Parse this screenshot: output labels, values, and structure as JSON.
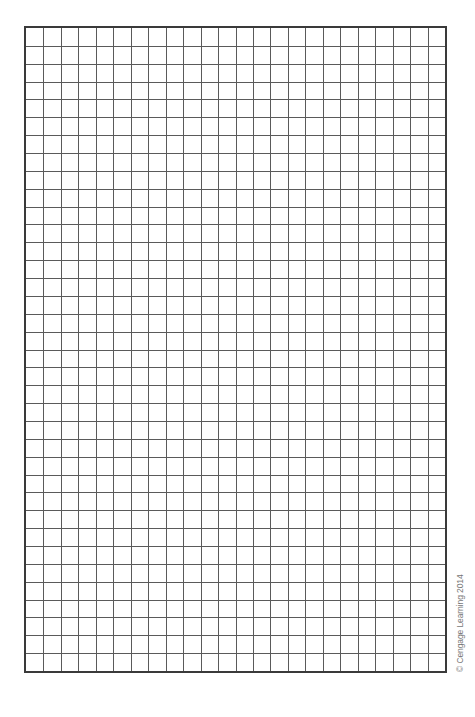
{
  "graph_paper": {
    "columns": 24,
    "rows": 36,
    "line_color": "#5a5a5a",
    "border_color": "#3a3a3a"
  },
  "credit": {
    "text": "© Cengage Learning 2014"
  }
}
